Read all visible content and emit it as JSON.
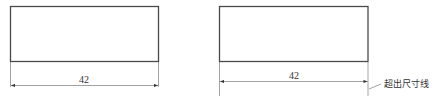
{
  "figures": [
    {
      "id": "left",
      "dimension_value": "42",
      "description": "Correct dimension: extension lines end at the dimension line"
    },
    {
      "id": "right",
      "dimension_value": "42",
      "annotation": "超出尺寸线",
      "description": "Extension lines extend beyond the dimension line"
    }
  ],
  "colors": {
    "outline": "#4a4a4a",
    "thin_line": "#8a8a8a",
    "text": "#333333"
  }
}
